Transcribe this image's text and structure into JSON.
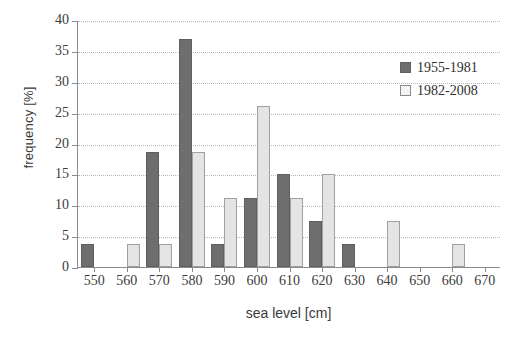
{
  "chart_data": {
    "type": "bar",
    "title": "",
    "xlabel": "sea level [cm]",
    "ylabel": "frequency [%]",
    "categories": [
      "550",
      "560",
      "570",
      "580",
      "590",
      "600",
      "610",
      "620",
      "630",
      "640",
      "650",
      "660",
      "670"
    ],
    "xlim": [
      545,
      675
    ],
    "ylim": [
      0,
      40
    ],
    "ytick_labels": [
      "0",
      "5",
      "10",
      "15",
      "20",
      "25",
      "30",
      "35",
      "40"
    ],
    "ytick_values": [
      0,
      5,
      10,
      15,
      20,
      25,
      30,
      35,
      40
    ],
    "grid": true,
    "legend_position": "top-right",
    "series": [
      {
        "name": "1955-1981",
        "color": "#6e6e6e",
        "values": [
          3.7,
          0,
          18.7,
          37.0,
          3.7,
          11.2,
          15.0,
          7.5,
          3.7,
          0,
          0,
          0,
          0
        ]
      },
      {
        "name": "1982-2008",
        "color": "#e4e4e4",
        "values": [
          0,
          3.7,
          3.7,
          18.7,
          11.2,
          26.0,
          11.2,
          15.0,
          0,
          7.5,
          0,
          3.7,
          0
        ]
      }
    ]
  }
}
